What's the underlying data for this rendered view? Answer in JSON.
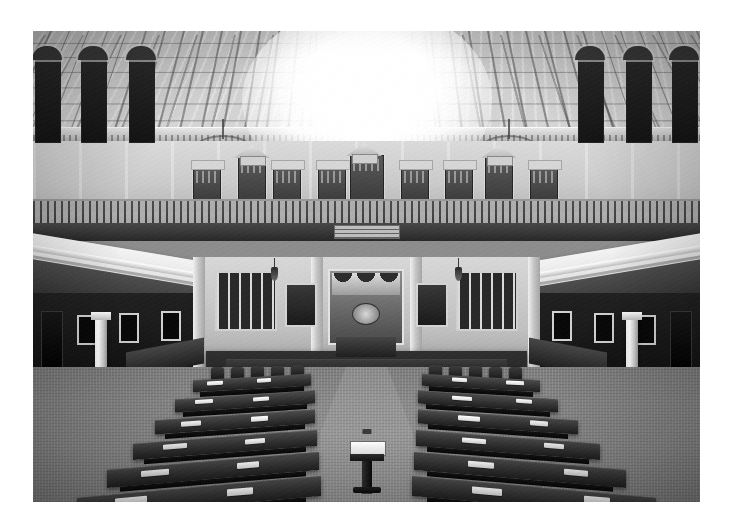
{
  "page": {
    "background_color": "#ffffff",
    "width": 735,
    "height": 531
  },
  "photo": {
    "subject": "legislative-chamber-interior",
    "alt_text": "Empty legislative chamber viewed from the gallery, Texas House of Representatives",
    "treatment": "black-and-white",
    "frame": {
      "left": 33,
      "top": 31,
      "width": 667,
      "height": 471
    },
    "tones": {
      "ceiling_light": "#d8d8d8",
      "wall_mid": "#c9c9c9",
      "carpet": "#8a8a8a",
      "desk_dark": "#2a2019",
      "shadow_black": "#101010",
      "paper_white": "#ffffff",
      "column_white": "#f5f5f5"
    }
  },
  "scene": {
    "ceiling": {
      "label": "coffered-ceiling",
      "chandelier_count": 2,
      "center_highlight": "overexposed-skylight-glare"
    },
    "gallery": {
      "label": "public-gallery",
      "seat_rows": 2,
      "doorway_count": 9,
      "sign_text": ""
    },
    "dais": {
      "label": "speakers-dais",
      "has_draped_flags": true,
      "has_central_seal": true,
      "voting_boards": 2,
      "portrait_frames": 4
    },
    "floor": {
      "label": "chamber-floor",
      "desk_rows": 11,
      "center_aisle": true,
      "lectern_present": true,
      "carpet_pattern": "fine-grid-weave"
    },
    "columns": {
      "label": "balcony-support-columns",
      "count": 2,
      "style": "cast-iron-corinthian"
    }
  }
}
